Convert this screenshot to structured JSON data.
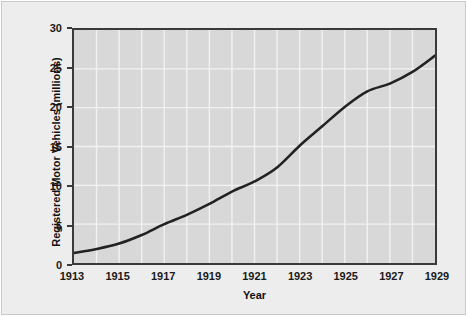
{
  "chart_data": {
    "type": "line",
    "title": "",
    "subtitle": "",
    "xlabel": "Year",
    "ylabel": "Registered Motor Vehicles (millions)",
    "xlim": [
      1913,
      1929
    ],
    "ylim": [
      0,
      30
    ],
    "xticks": [
      1913,
      1915,
      1917,
      1919,
      1921,
      1923,
      1925,
      1927,
      1929
    ],
    "xtick_labels": [
      "1913",
      "1915",
      "1917",
      "1919",
      "1921",
      "1923",
      "1925",
      "1927",
      "1929"
    ],
    "yticks": [
      0,
      5,
      10,
      15,
      20,
      25,
      30
    ],
    "ytick_labels": [
      "0",
      "5",
      "10",
      "15",
      "20",
      "25",
      "30"
    ],
    "grid": true,
    "grid_color": "#f2f2f2",
    "grid_x_step": 1,
    "grid_y_step": 5,
    "legend": null,
    "plot_background": "#d8d8d8",
    "figure_background": "#ededed",
    "line_color": "#222222",
    "line_width": 2.6,
    "x": [
      1913,
      1914,
      1915,
      1916,
      1917,
      1918,
      1919,
      1920,
      1921,
      1922,
      1923,
      1924,
      1925,
      1926,
      1927,
      1928,
      1929
    ],
    "values": [
      1.3,
      1.8,
      2.5,
      3.6,
      5.0,
      6.2,
      7.6,
      9.2,
      10.5,
      12.3,
      15.1,
      17.6,
      20.1,
      22.1,
      23.1,
      24.6,
      26.7
    ],
    "series": [
      {
        "name": "Registered Motor Vehicles",
        "values": [
          1.3,
          1.8,
          2.5,
          3.6,
          5.0,
          6.2,
          7.6,
          9.2,
          10.5,
          12.3,
          15.1,
          17.6,
          20.1,
          22.1,
          23.1,
          24.6,
          26.7
        ]
      }
    ]
  }
}
